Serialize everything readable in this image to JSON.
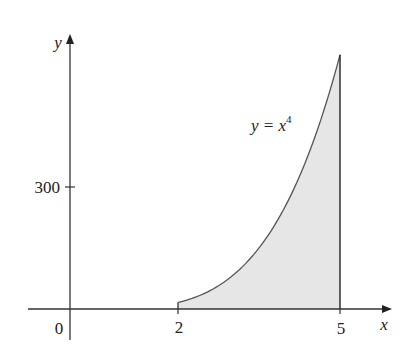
{
  "chart_data": {
    "type": "area",
    "title": "",
    "function": "y = x^4",
    "annotation": {
      "text_main": "y = x",
      "superscript": "4"
    },
    "xlabel": "x",
    "ylabel": "y",
    "x_ticks": [
      "0",
      "2",
      "5"
    ],
    "y_ticks": [
      "300"
    ],
    "shaded_region": {
      "from_x": 2,
      "to_x": 5,
      "under": "y = x^4"
    },
    "xlim": [
      -0.8,
      5.8
    ],
    "ylim": [
      0,
      680
    ],
    "x": [
      2,
      2.5,
      3,
      3.5,
      4,
      4.5,
      5
    ],
    "values": [
      16,
      39.06,
      81,
      150.06,
      256,
      410.06,
      625
    ],
    "grid": false,
    "colors": {
      "fill": "#e6e6e6",
      "curve": "#555555",
      "axis": "#333333"
    }
  }
}
